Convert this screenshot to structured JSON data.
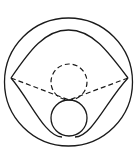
{
  "diagram": {
    "colors": {
      "stroke": "#1a1a1a",
      "background": "#ffffff"
    },
    "outer_circle": {
      "cx": 68.5,
      "cy": 82,
      "r": 64
    },
    "left_vertex": {
      "x": 11,
      "y": 78
    },
    "right_vertex": {
      "x": 128,
      "y": 78
    },
    "tangent_point": {
      "x": 69,
      "y": 100
    },
    "dashed_circle": {
      "cx": 69,
      "cy": 82,
      "r": 18
    },
    "solid_circle": {
      "cx": 69,
      "cy": 118,
      "r": 18
    }
  }
}
